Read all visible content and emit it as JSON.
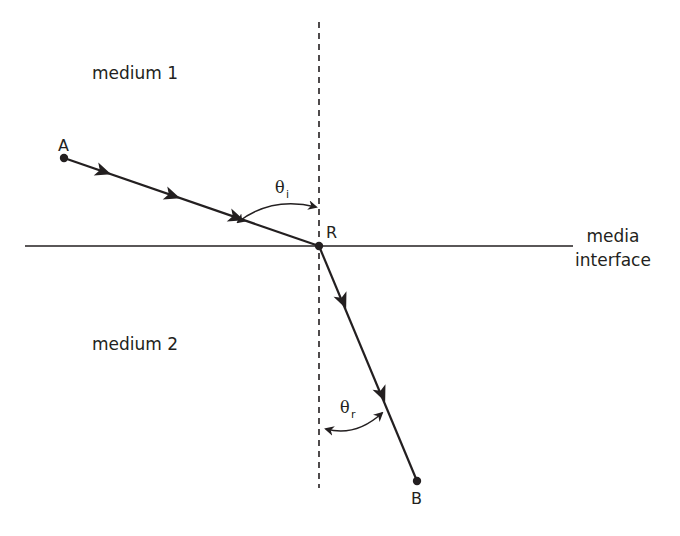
{
  "diagram": {
    "type": "refraction",
    "labels": {
      "medium1": "medium 1",
      "medium2": "medium 2",
      "interface_line1": "media",
      "interface_line2": "interface",
      "point_a": "A",
      "point_r": "R",
      "point_b": "B",
      "theta_i_symbol": "θ",
      "theta_i_sub": "i",
      "theta_r_symbol": "θ",
      "theta_r_sub": "r"
    },
    "colors": {
      "line": "#231f20",
      "background": "#ffffff"
    },
    "points": {
      "A": [
        64,
        158
      ],
      "R": [
        319,
        246
      ],
      "B": [
        417,
        481
      ]
    }
  }
}
